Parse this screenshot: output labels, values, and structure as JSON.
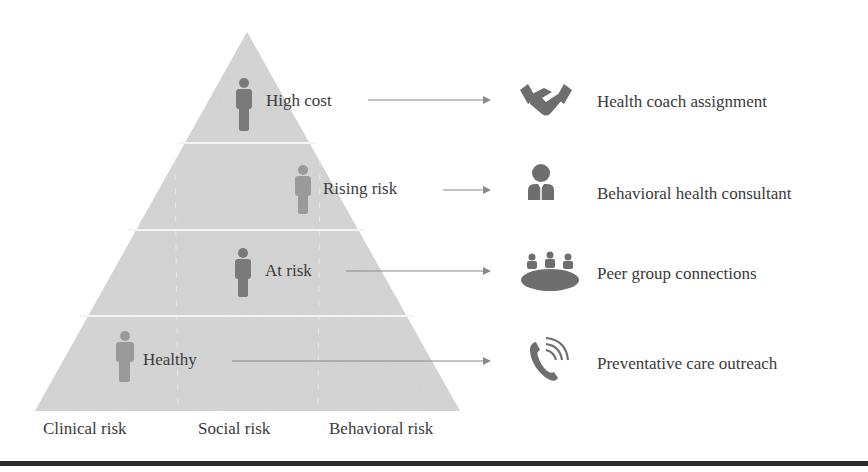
{
  "diagram": {
    "type": "risk-stratification-pyramid",
    "colors": {
      "pyramid_fill": "#d6d6d6",
      "tier_divider": "#f2f2f2",
      "person_dark": "#7a7a7a",
      "person_light": "#9a9a9a",
      "arrow": "#8a8a8a",
      "icon": "#6e6e6e",
      "text": "#3a3a3a",
      "bottom_rule": "#2a2a2a"
    },
    "tiers": [
      {
        "label": "High cost",
        "action": "Health coach assignment",
        "icon": "handshake-icon"
      },
      {
        "label": "Rising risk",
        "action": "Behavioral health consultant",
        "icon": "consultant-person-icon"
      },
      {
        "label": "At risk",
        "action": "Peer group connections",
        "icon": "group-meeting-table-icon"
      },
      {
        "label": "Healthy",
        "action": "Preventative care outreach",
        "icon": "phone-ringing-icon"
      }
    ],
    "axis_labels": [
      "Clinical risk",
      "Social risk",
      "Behavioral risk"
    ]
  }
}
